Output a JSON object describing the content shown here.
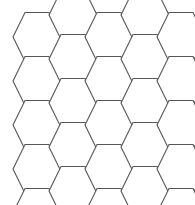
{
  "canvas": {
    "width": 195,
    "height": 205,
    "background_color": "#ffffff",
    "description": "hexagonal-grid-tiling"
  },
  "style": {
    "stroke_color": "#565656",
    "stroke_width": 1.1,
    "fill_color": "#ffffff"
  },
  "grid": {
    "orientation": "flat-top",
    "hex_width": 48,
    "hex_height": 49,
    "column_pitch": 72,
    "row_pitch": 44,
    "column_vertical_offset": 22,
    "columns": 5,
    "rows_per_column": 5,
    "clipped_right": true,
    "clipped_bottom": true,
    "origin_x": 13,
    "origin_y": 13
  },
  "cells": [
    {
      "id": "c0r0",
      "col": 0,
      "row": 0,
      "cx": 37,
      "cy": 37
    },
    {
      "id": "c0r1",
      "col": 0,
      "row": 1,
      "cx": 37,
      "cy": 81
    },
    {
      "id": "c0r2",
      "col": 0,
      "row": 2,
      "cx": 37,
      "cy": 125
    },
    {
      "id": "c0r3",
      "col": 0,
      "row": 3,
      "cx": 37,
      "cy": 169
    },
    {
      "id": "c0r4",
      "col": 0,
      "row": 4,
      "cx": 37,
      "cy": 213
    },
    {
      "id": "c1r0",
      "col": 1,
      "row": 0,
      "cx": 73,
      "cy": 15
    },
    {
      "id": "c1r1",
      "col": 1,
      "row": 1,
      "cx": 73,
      "cy": 59
    },
    {
      "id": "c1r2",
      "col": 1,
      "row": 2,
      "cx": 73,
      "cy": 103
    },
    {
      "id": "c1r3",
      "col": 1,
      "row": 3,
      "cx": 73,
      "cy": 147
    },
    {
      "id": "c1r4",
      "col": 1,
      "row": 4,
      "cx": 73,
      "cy": 191
    },
    {
      "id": "c2r0",
      "col": 2,
      "row": 0,
      "cx": 109,
      "cy": 37
    },
    {
      "id": "c2r1",
      "col": 2,
      "row": 1,
      "cx": 109,
      "cy": 81
    },
    {
      "id": "c2r2",
      "col": 2,
      "row": 2,
      "cx": 109,
      "cy": 125
    },
    {
      "id": "c2r3",
      "col": 2,
      "row": 3,
      "cx": 109,
      "cy": 169
    },
    {
      "id": "c2r4",
      "col": 2,
      "row": 4,
      "cx": 109,
      "cy": 213
    },
    {
      "id": "c3r0",
      "col": 3,
      "row": 0,
      "cx": 145,
      "cy": 15
    },
    {
      "id": "c3r1",
      "col": 3,
      "row": 1,
      "cx": 145,
      "cy": 59
    },
    {
      "id": "c3r2",
      "col": 3,
      "row": 2,
      "cx": 145,
      "cy": 103
    },
    {
      "id": "c3r3",
      "col": 3,
      "row": 3,
      "cx": 145,
      "cy": 147
    },
    {
      "id": "c3r4",
      "col": 3,
      "row": 4,
      "cx": 145,
      "cy": 191
    },
    {
      "id": "c4r0",
      "col": 4,
      "row": 0,
      "cx": 181,
      "cy": 37
    },
    {
      "id": "c4r1",
      "col": 4,
      "row": 1,
      "cx": 181,
      "cy": 81
    },
    {
      "id": "c4r2",
      "col": 4,
      "row": 2,
      "cx": 181,
      "cy": 125
    },
    {
      "id": "c4r3",
      "col": 4,
      "row": 3,
      "cx": 181,
      "cy": 169
    },
    {
      "id": "c4r4",
      "col": 4,
      "row": 4,
      "cx": 181,
      "cy": 213
    }
  ]
}
